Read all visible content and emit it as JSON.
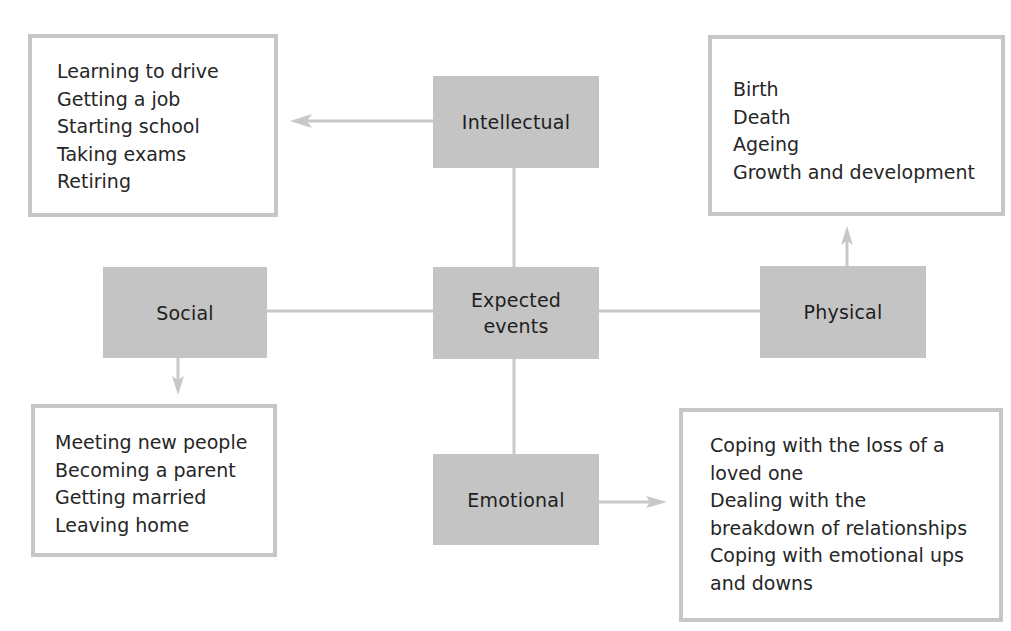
{
  "diagram": {
    "center": {
      "label": "Expected\nevents"
    },
    "categories": {
      "intellectual": {
        "label": "Intellectual"
      },
      "social": {
        "label": "Social"
      },
      "physical": {
        "label": "Physical"
      },
      "emotional": {
        "label": "Emotional"
      }
    },
    "examples": {
      "intellectual": {
        "items": [
          "Learning to drive",
          "Getting a job",
          "Starting school",
          "Taking exams",
          "Retiring"
        ]
      },
      "physical": {
        "items": [
          "Birth",
          "Death",
          "Ageing",
          "Growth and development"
        ]
      },
      "social": {
        "items": [
          "Meeting new people",
          "Becoming a parent",
          "Getting married",
          "Leaving home"
        ]
      },
      "emotional": {
        "items": [
          "Coping with the loss of a",
          "loved one",
          "Dealing with the",
          "breakdown of relationships",
          "Coping with emotional ups",
          "and downs"
        ]
      }
    },
    "colors": {
      "category_fill": "#c4c4c4",
      "box_border": "#c6c6c6",
      "connector": "#c8c8c8",
      "text": "#222222",
      "background": "#ffffff"
    }
  }
}
